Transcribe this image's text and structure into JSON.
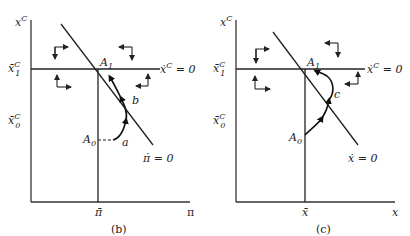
{
  "figure": {
    "panels": [
      {
        "id": "b",
        "caption": "(b)",
        "y_axis_label": "x",
        "y_axis_label_sup": "C",
        "x_axis_label": "π",
        "x_tick_label": "π̄",
        "y_tick_upper": "x̄",
        "y_tick_upper_sup": "C",
        "y_tick_upper_sub": "1",
        "y_tick_lower": "x̄",
        "y_tick_lower_sup": "C",
        "y_tick_lower_sub": "0",
        "horizontal_locus_label": "ẋ",
        "horizontal_locus_sup": "C",
        "horizontal_locus_eq": " = 0",
        "diagonal_locus_label": "π̇ = 0",
        "point_A1": "A",
        "point_A1_sub": "1",
        "point_A0": "A",
        "point_A0_sub": "0",
        "point_a": "a",
        "point_b": "b"
      },
      {
        "id": "c",
        "caption": "(c)",
        "y_axis_label": "x",
        "y_axis_label_sup": "C",
        "x_axis_label": "x",
        "x_tick_label": "x̄",
        "y_tick_upper": "x̄",
        "y_tick_upper_sup": "C",
        "y_tick_upper_sub": "1",
        "y_tick_lower": "x̄",
        "y_tick_lower_sup": "C",
        "y_tick_lower_sub": "0",
        "horizontal_locus_label": "ẋ",
        "horizontal_locus_sup": "C",
        "horizontal_locus_eq": " = 0",
        "diagonal_locus_label": "ẋ = 0",
        "point_A1": "A",
        "point_A1_sub": "1",
        "point_A0": "A",
        "point_A0_sub": "0",
        "point_c": "c"
      }
    ],
    "colors": {
      "ink": "#222222",
      "background": "#ffffff"
    }
  }
}
